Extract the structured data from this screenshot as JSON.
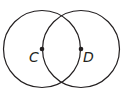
{
  "diagram": {
    "type": "two intersecting circles",
    "stroke_color": "#231f20",
    "points": [
      {
        "label": "C",
        "x": 42,
        "y": 49
      },
      {
        "label": "D",
        "x": 81,
        "y": 49
      }
    ],
    "circles": [
      {
        "center": "C",
        "cx": 42,
        "cy": 49,
        "r": 39
      },
      {
        "center": "D",
        "cx": 81,
        "cy": 49,
        "r": 39
      }
    ]
  }
}
